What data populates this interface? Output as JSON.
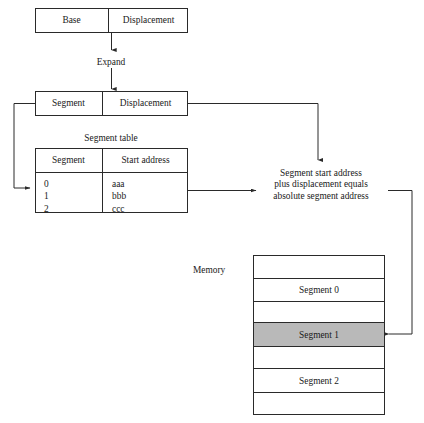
{
  "diagram": {
    "address_before": {
      "fields": [
        {
          "label": "Base"
        },
        {
          "label": "Displacement"
        }
      ]
    },
    "transform_label": "Expand",
    "address_after": {
      "fields": [
        {
          "label": "Segment"
        },
        {
          "label": "Displacement"
        }
      ]
    },
    "segment_table": {
      "caption": "Segment table",
      "columns": [
        "Segment",
        "Start address"
      ],
      "rows": [
        {
          "segment": "0",
          "start_address": "aaa"
        },
        {
          "segment": "1",
          "start_address": "bbb"
        },
        {
          "segment": "2",
          "start_address": "ccc"
        }
      ]
    },
    "formula": {
      "line1": "Segment start address",
      "line2": "plus displacement equals",
      "line3": "absolute segment address"
    },
    "memory": {
      "label": "Memory",
      "rows": [
        {
          "label": "",
          "shaded": false
        },
        {
          "label": "Segment 0",
          "shaded": false
        },
        {
          "label": "",
          "shaded": false
        },
        {
          "label": "Segment 1",
          "shaded": true
        },
        {
          "label": "",
          "shaded": false
        },
        {
          "label": "Segment 2",
          "shaded": false
        },
        {
          "label": "",
          "shaded": false
        }
      ]
    },
    "colors": {
      "line": "#2a2a2a",
      "highlight_fill": "#b9b9b9",
      "background": "#ffffff",
      "text": "#1a1a1a"
    }
  }
}
